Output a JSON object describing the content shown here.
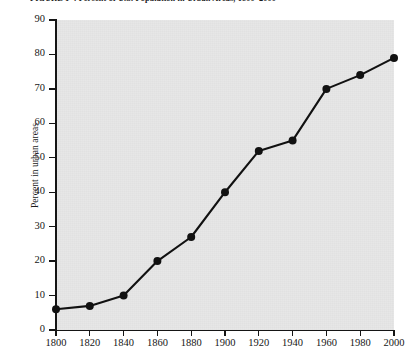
{
  "caption": {
    "number": "FIGURE 1-4",
    "text": "Percent of U.S. Population in Urban Areas, 1800–2000",
    "full": "FIGURE 1-4  Percent of U.S. Population in Urban Areas, 1800–2000"
  },
  "chart_data": {
    "type": "line",
    "title": "Percent of U.S. Population in Urban Areas, 1800–2000",
    "xlabel": "",
    "ylabel": "Percent in urban areas",
    "x": [
      1800,
      1820,
      1840,
      1860,
      1880,
      1900,
      1920,
      1940,
      1960,
      1980,
      2000
    ],
    "categories": [
      "1800",
      "1820",
      "1840",
      "1860",
      "1880",
      "1900",
      "1920",
      "1940",
      "1960",
      "1980",
      "2000"
    ],
    "values": [
      6,
      7,
      10,
      20,
      27,
      40,
      52,
      55,
      70,
      74,
      79
    ],
    "series": [
      {
        "name": "Percent in urban areas",
        "values": [
          6,
          7,
          10,
          20,
          27,
          40,
          52,
          55,
          70,
          74,
          79
        ]
      }
    ],
    "xlim": [
      1800,
      2000
    ],
    "ylim": [
      0,
      90
    ],
    "xticks": [
      1800,
      1820,
      1840,
      1860,
      1880,
      1900,
      1920,
      1940,
      1960,
      1980,
      2000
    ],
    "yticks": [
      0,
      10,
      20,
      30,
      40,
      50,
      60,
      70,
      80,
      90
    ],
    "xtick_labels": [
      "1800",
      "1820",
      "1840",
      "1860",
      "1880",
      "1900",
      "1920",
      "1940",
      "1960",
      "1980",
      "2000"
    ],
    "ytick_labels": [
      "0",
      "10",
      "20",
      "30",
      "40",
      "50",
      "60",
      "70",
      "80",
      "90"
    ],
    "grid": false,
    "legend": null,
    "legend_position": "none",
    "marker": "filled-circle",
    "line_color": "#111111",
    "marker_color": "#111111",
    "plot_background": "#e7e7e7",
    "figure_background": "#ffffff"
  }
}
